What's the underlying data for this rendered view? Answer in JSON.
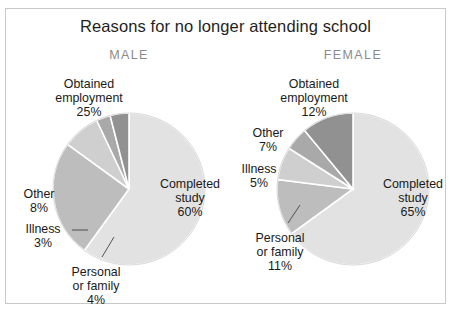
{
  "figure": {
    "title": "Reasons for no longer attending school",
    "border_color": "#c9c9c9",
    "background": "#ffffff"
  },
  "palette": {
    "completed_study": "#e2e2e2",
    "obtained_employment": "#bdbdbd",
    "other": "#cfcfcf",
    "illness": "#a9a9a9",
    "personal_or_family": "#919191",
    "slice_separator": "#ffffff",
    "label_text": "#1a1a1a",
    "heading_text": "#8a8a8a"
  },
  "chart_data": [
    {
      "type": "pie",
      "title": "MALE",
      "labels": [
        "Completed study",
        "Obtained employment",
        "Other",
        "Illness",
        "Personal or family"
      ],
      "values": [
        60,
        25,
        8,
        3,
        4
      ],
      "value_labels": [
        "60%",
        "25%",
        "8%",
        "3%",
        "4%"
      ],
      "units": "percent",
      "start_angle_deg": 0,
      "direction": "clockwise",
      "legend": "none",
      "colors": [
        "#e2e2e2",
        "#bdbdbd",
        "#cfcfcf",
        "#a9a9a9",
        "#919191"
      ]
    },
    {
      "type": "pie",
      "title": "FEMALE",
      "labels": [
        "Completed study",
        "Obtained employment",
        "Other",
        "Illness",
        "Personal or family"
      ],
      "values": [
        65,
        12,
        7,
        5,
        11
      ],
      "value_labels": [
        "65%",
        "12%",
        "7%",
        "5%",
        "11%"
      ],
      "units": "percent",
      "start_angle_deg": 0,
      "direction": "clockwise",
      "legend": "none",
      "colors": [
        "#e2e2e2",
        "#bdbdbd",
        "#cfcfcf",
        "#a9a9a9",
        "#919191"
      ]
    }
  ],
  "male": {
    "heading": "MALE",
    "labels": {
      "obtained_employment": "Obtained\nemployment\n25%",
      "other": "Other\n8%",
      "illness": "Illness\n3%",
      "personal_or_family": "Personal\nor family\n4%",
      "completed_study": "Completed\nstudy\n60%"
    }
  },
  "female": {
    "heading": "FEMALE",
    "labels": {
      "obtained_employment": "Obtained\nemployment\n12%",
      "other": "Other\n7%",
      "illness": "Illness\n5%",
      "personal_or_family": "Personal\nor family\n11%",
      "completed_study": "Completed\nstudy\n65%"
    }
  }
}
